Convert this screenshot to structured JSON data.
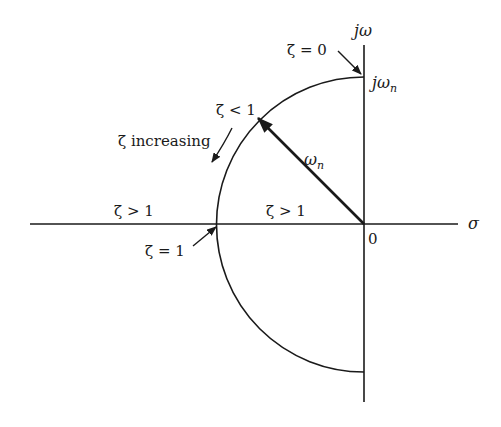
{
  "diagram": {
    "axes": {
      "vertical_label": "jω",
      "horizontal_label": "σ",
      "origin_label": "0"
    },
    "circle_top_label": "jω",
    "circle_top_label_sub": "n",
    "radius_label": "ω",
    "radius_label_sub": "n",
    "annotations": {
      "zeta_zero": "ζ = 0",
      "zeta_less_one": "ζ < 1",
      "zeta_increasing": "ζ increasing",
      "zeta_greater_one_left": "ζ > 1",
      "zeta_greater_one_right": "ζ > 1",
      "zeta_one": "ζ = 1"
    },
    "colors": {
      "stroke": "#1a1a1a",
      "background": "#ffffff"
    }
  }
}
